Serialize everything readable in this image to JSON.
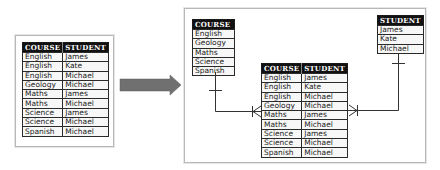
{
  "source_table": {
    "headers": [
      "COURSE",
      "STUDENT"
    ],
    "rows": [
      [
        "English",
        "James"
      ],
      [
        "English",
        "Kate"
      ],
      [
        "English",
        "Michael"
      ],
      [
        "Geology",
        "Michael"
      ],
      [
        "Maths",
        "James"
      ],
      [
        "Maths",
        "Michael"
      ],
      [
        "Science",
        "James"
      ],
      [
        "Science",
        "Michael"
      ],
      [
        "Spanish",
        "Michael"
      ]
    ]
  },
  "arrow": {
    "color": "#707070",
    "direction": "right"
  },
  "result": {
    "course_table": {
      "header": "COURSE",
      "rows": [
        "English",
        "Geology",
        "Maths",
        "Science",
        "Spanish"
      ]
    },
    "student_table": {
      "header": "STUDENT",
      "rows": [
        "James",
        "Kate",
        "Michael"
      ]
    },
    "link_table": {
      "headers": [
        "COURSE",
        "STUDENT"
      ],
      "rows": [
        [
          "English",
          "James"
        ],
        [
          "English",
          "Kate"
        ],
        [
          "English",
          "Michael"
        ],
        [
          "Geology",
          "Michael"
        ],
        [
          "Maths",
          "James"
        ],
        [
          "Maths",
          "Michael"
        ],
        [
          "Science",
          "James"
        ],
        [
          "Science",
          "Michael"
        ],
        [
          "Spanish",
          "Michael"
        ]
      ]
    },
    "relationships": [
      {
        "from": "COURSE",
        "to": "COURSE/STUDENT",
        "type": "one-to-many"
      },
      {
        "from": "STUDENT",
        "to": "COURSE/STUDENT",
        "type": "one-to-many"
      }
    ]
  }
}
